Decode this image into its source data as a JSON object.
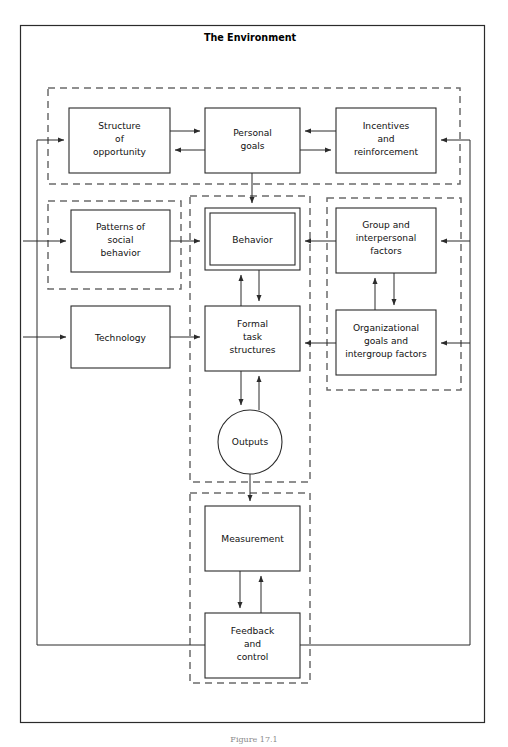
{
  "figure": {
    "title": "The Environment",
    "caption": "Figure 17.1",
    "type": "block-flow-diagram",
    "colors": {
      "background": "#ffffff",
      "stroke": "#2b2b2b",
      "dashed_stroke": "#6b6b6b",
      "text": "#111111",
      "caption": "#8a8a8a"
    }
  },
  "outer_frame": {
    "label": "The Environment",
    "style": "solid"
  },
  "groups": [
    {
      "name": "personal-group",
      "style": "dashed",
      "x": 48,
      "y": 88,
      "w": 412,
      "h": 96
    },
    {
      "name": "social-group",
      "style": "dashed",
      "x": 48,
      "y": 201,
      "w": 133,
      "h": 88
    },
    {
      "name": "central-group",
      "style": "dashed",
      "x": 190,
      "y": 196,
      "w": 120,
      "h": 286
    },
    {
      "name": "right-group",
      "style": "dashed",
      "x": 327,
      "y": 198,
      "w": 134,
      "h": 192
    },
    {
      "name": "control-group",
      "style": "dashed",
      "x": 190,
      "y": 493,
      "w": 120,
      "h": 190
    }
  ],
  "nodes": [
    {
      "id": "structure",
      "label": "Structure\nof\nopportunity",
      "shape": "rect",
      "x": 69,
      "y": 108,
      "w": 101,
      "h": 65
    },
    {
      "id": "personal_goals",
      "label": "Personal\ngoals",
      "shape": "rect",
      "x": 205,
      "y": 108,
      "w": 95,
      "h": 65
    },
    {
      "id": "incentives",
      "label": "Incentives\nand\nreinforcement",
      "shape": "rect",
      "x": 336,
      "y": 108,
      "w": 100,
      "h": 65
    },
    {
      "id": "patterns",
      "label": "Patterns of\nsocial\nbehavior",
      "shape": "rect",
      "x": 71,
      "y": 210,
      "w": 99,
      "h": 62
    },
    {
      "id": "behavior",
      "label": "Behavior",
      "shape": "double-rect",
      "x": 205,
      "y": 208,
      "w": 95,
      "h": 62
    },
    {
      "id": "group_inter",
      "label": "Group and\ninterpersonal\nfactors",
      "shape": "rect",
      "x": 336,
      "y": 208,
      "w": 100,
      "h": 65
    },
    {
      "id": "technology",
      "label": "Technology",
      "shape": "rect",
      "x": 71,
      "y": 306,
      "w": 99,
      "h": 62
    },
    {
      "id": "formal_task",
      "label": "Formal\ntask\nstructures",
      "shape": "rect",
      "x": 205,
      "y": 306,
      "w": 95,
      "h": 65
    },
    {
      "id": "org_goals",
      "label": "Organizational\ngoals and\nintergroup factors",
      "shape": "rect",
      "x": 336,
      "y": 310,
      "w": 100,
      "h": 65
    },
    {
      "id": "outputs",
      "label": "Outputs",
      "shape": "circle",
      "cx": 250,
      "cy": 442,
      "r": 32
    },
    {
      "id": "measurement",
      "label": "Measurement",
      "shape": "rect",
      "x": 205,
      "y": 506,
      "w": 95,
      "h": 65
    },
    {
      "id": "feedback",
      "label": "Feedback\nand\ncontrol",
      "shape": "rect",
      "x": 205,
      "y": 613,
      "w": 95,
      "h": 65
    }
  ],
  "edges": [
    {
      "from": "structure",
      "to": "personal_goals",
      "direction": "right"
    },
    {
      "from": "personal_goals",
      "to": "structure",
      "direction": "left"
    },
    {
      "from": "incentives",
      "to": "personal_goals",
      "direction": "left"
    },
    {
      "from": "personal_goals",
      "to": "incentives",
      "direction": "right"
    },
    {
      "from": "personal_goals",
      "to": "behavior",
      "direction": "down"
    },
    {
      "from": "patterns",
      "to": "behavior",
      "direction": "right"
    },
    {
      "from": "group_inter",
      "to": "behavior",
      "direction": "left"
    },
    {
      "from": "behavior",
      "to": "formal_task",
      "direction": "down"
    },
    {
      "from": "formal_task",
      "to": "behavior",
      "direction": "up"
    },
    {
      "from": "technology",
      "to": "formal_task",
      "direction": "right"
    },
    {
      "from": "org_goals",
      "to": "formal_task",
      "direction": "left"
    },
    {
      "from": "group_inter",
      "to": "org_goals",
      "direction": "down"
    },
    {
      "from": "org_goals",
      "to": "group_inter",
      "direction": "up"
    },
    {
      "from": "formal_task",
      "to": "outputs",
      "direction": "down"
    },
    {
      "from": "outputs",
      "to": "formal_task",
      "direction": "up"
    },
    {
      "from": "outputs",
      "to": "measurement",
      "direction": "down"
    },
    {
      "from": "measurement",
      "to": "feedback",
      "direction": "down"
    },
    {
      "from": "feedback",
      "to": "measurement",
      "direction": "up"
    },
    {
      "from": "feedback",
      "to": "structure",
      "direction": "loop-left"
    },
    {
      "from": "feedback",
      "to": "patterns",
      "direction": "loop-left"
    },
    {
      "from": "feedback",
      "to": "technology",
      "direction": "loop-left"
    },
    {
      "from": "feedback",
      "to": "incentives",
      "direction": "loop-right"
    },
    {
      "from": "feedback",
      "to": "group_inter",
      "direction": "loop-right"
    },
    {
      "from": "feedback",
      "to": "org_goals",
      "direction": "loop-right"
    }
  ]
}
